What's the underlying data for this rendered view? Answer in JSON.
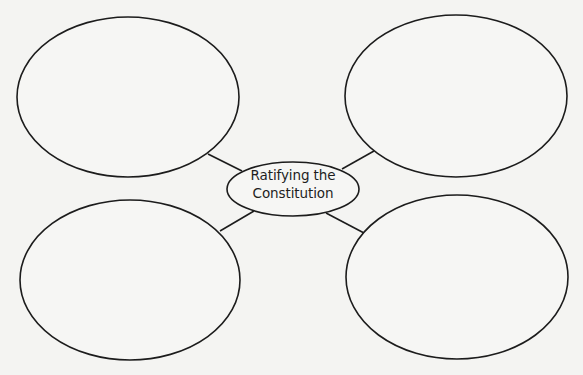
{
  "diagram": {
    "type": "concept-web",
    "center": {
      "label_line1": "Ratifying the",
      "label_line2": "Constitution",
      "cx": 293,
      "cy": 189,
      "rx": 66,
      "ry": 27
    },
    "bubbles": [
      {
        "id": "top-left",
        "cx": 128,
        "cy": 97,
        "rx": 111,
        "ry": 80,
        "text": ""
      },
      {
        "id": "top-right",
        "cx": 456,
        "cy": 96,
        "rx": 111,
        "ry": 81,
        "text": ""
      },
      {
        "id": "bottom-left",
        "cx": 130,
        "cy": 280,
        "rx": 110,
        "ry": 80,
        "text": ""
      },
      {
        "id": "bottom-right",
        "cx": 457,
        "cy": 277,
        "rx": 111,
        "ry": 82,
        "text": ""
      }
    ],
    "connectors": [
      {
        "id": "top-left",
        "x1": 208,
        "y1": 154,
        "x2": 242,
        "y2": 171
      },
      {
        "id": "top-right",
        "x1": 342,
        "y1": 169,
        "x2": 374,
        "y2": 151
      },
      {
        "id": "bottom-left",
        "x1": 254,
        "y1": 211,
        "x2": 220,
        "y2": 231
      },
      {
        "id": "bottom-right",
        "x1": 326,
        "y1": 213,
        "x2": 364,
        "y2": 233
      }
    ],
    "colors": {
      "background": "#f4f4f2",
      "stroke": "#1c1c1c",
      "text": "#1e1e1e"
    }
  }
}
